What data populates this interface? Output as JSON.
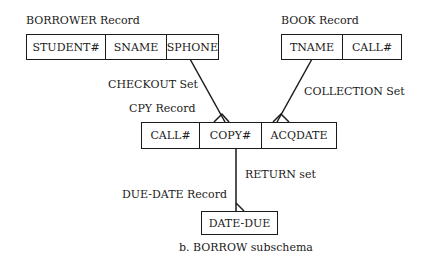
{
  "records": {
    "borrower": {
      "title": "BORROWER Record",
      "fields": [
        "STUDENT#",
        "SNAME",
        "SPHONE"
      ]
    },
    "book": {
      "title": "BOOK Record",
      "fields": [
        "TNAME",
        "CALL#"
      ]
    },
    "cpy": {
      "title": "CPY Record",
      "fields": [
        "CALL#",
        "COPY#",
        "ACQDATE"
      ]
    },
    "due_date": {
      "title": "DUE-DATE Record",
      "fields": [
        "DATE-DUE"
      ]
    }
  },
  "sets": {
    "checkout": "CHECKOUT  Set",
    "collection": "COLLECTION Set",
    "return": "RETURN set"
  },
  "caption": "b.  BORROW subschema"
}
